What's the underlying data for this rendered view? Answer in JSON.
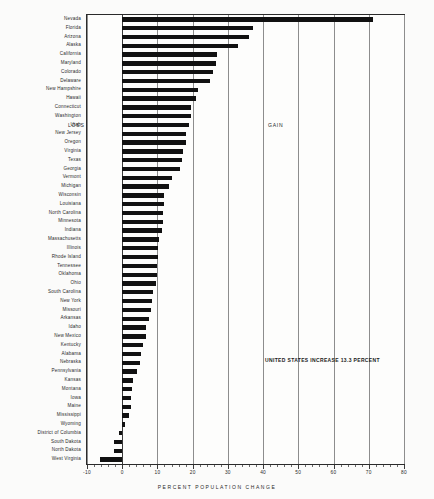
{
  "chart_data": {
    "type": "bar",
    "orientation": "horizontal",
    "title": "",
    "xlabel": "PERCENT POPULATION CHANGE",
    "ylabel": "",
    "xlim": [
      -10,
      80
    ],
    "xticks": [
      -10,
      0,
      10,
      20,
      30,
      40,
      50,
      60,
      70,
      80
    ],
    "xtick_labels": [
      "-10",
      "0",
      "10",
      "20",
      "30",
      "40",
      "50",
      "60",
      "70",
      "80"
    ],
    "grid": true,
    "gridlines_at": [
      -10,
      0,
      10,
      20,
      30,
      40,
      50,
      60,
      70,
      80
    ],
    "zero_line": 0,
    "categories": [
      "Nevada",
      "Florida",
      "Arizona",
      "Alaska",
      "California",
      "Maryland",
      "Colorado",
      "Delaware",
      "New Hampshire",
      "Hawaii",
      "Connecticut",
      "Washington",
      "Utah",
      "New Jersey",
      "Oregon",
      "Virginia",
      "Texas",
      "Georgia",
      "Vermont",
      "Michigan",
      "Wisconsin",
      "Louisiana",
      "North Carolina",
      "Minnesota",
      "Indiana",
      "Massachusetts",
      "Illinois",
      "Rhode Island",
      "Tennessee",
      "Oklahoma",
      "Ohio",
      "South Carolina",
      "New York",
      "Missouri",
      "Arkansas",
      "Idaho",
      "New Mexico",
      "Kentucky",
      "Alabama",
      "Nebraska",
      "Pennsylvania",
      "Kansas",
      "Montana",
      "Iowa",
      "Maine",
      "Mississippi",
      "Wyoming",
      "District of Columbia",
      "South Dakota",
      "North Dakota",
      "West Virginia"
    ],
    "values": [
      71.3,
      37.1,
      36.1,
      32.8,
      27.0,
      26.5,
      25.8,
      25.0,
      21.5,
      21.0,
      19.6,
      19.5,
      18.9,
      18.2,
      18.2,
      17.2,
      16.9,
      16.4,
      14.1,
      13.4,
      11.8,
      11.8,
      11.5,
      11.5,
      11.4,
      10.5,
      10.2,
      10.1,
      10.0,
      9.9,
      9.7,
      8.7,
      8.4,
      8.3,
      7.7,
      6.8,
      6.8,
      5.9,
      5.4,
      5.1,
      4.2,
      3.1,
      2.9,
      2.4,
      2.4,
      1.8,
      0.7,
      -1.0,
      -2.2,
      -2.3,
      -6.2
    ],
    "bar_color": "#111111",
    "annotations": [
      {
        "name": "loss-label",
        "text": "LOSS"
      },
      {
        "name": "gain-label",
        "text": "GAIN"
      },
      {
        "name": "us-increase-note",
        "text": "UNITED STATES INCREASE 13.3 PERCENT"
      }
    ]
  },
  "annotations": {
    "loss": "LOSS",
    "gain": "GAIN",
    "us_increase": "UNITED STATES INCREASE 13.3 PERCENT"
  }
}
